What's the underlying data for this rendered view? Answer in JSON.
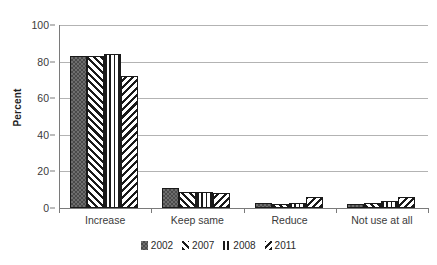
{
  "chart_data": {
    "type": "bar",
    "title": "",
    "xlabel": "",
    "ylabel": "Percent",
    "ylim": [
      0,
      100
    ],
    "yticks": [
      0,
      20,
      40,
      60,
      80,
      100
    ],
    "grid": true,
    "legend_position": "bottom",
    "categories": [
      "Increase",
      "Keep same",
      "Reduce",
      "Not use at all"
    ],
    "series": [
      {
        "name": "2002",
        "pattern": "checker-dotted",
        "values": [
          83,
          11,
          3,
          2
        ]
      },
      {
        "name": "2007",
        "pattern": "forward-diagonal",
        "values": [
          83,
          9,
          2,
          3
        ]
      },
      {
        "name": "2008",
        "pattern": "vertical-lines",
        "values": [
          84,
          9,
          3,
          4
        ]
      },
      {
        "name": "2011",
        "pattern": "backward-diagonal",
        "values": [
          72,
          8,
          6,
          6
        ]
      }
    ]
  },
  "axis": {
    "y_title": "Percent",
    "y_tick_labels": [
      "100",
      "80",
      "60",
      "40",
      "20",
      "0"
    ],
    "x_tick_labels": [
      "Increase",
      "Keep same",
      "Reduce",
      "Not use at all"
    ]
  },
  "legend": {
    "items": [
      {
        "label": "2002"
      },
      {
        "label": "2007"
      },
      {
        "label": "2008"
      },
      {
        "label": "2011"
      }
    ]
  },
  "colors": {
    "axis": "#7a7a7a",
    "gridline": "#b3b3b3",
    "bar_outline": "#1a1a1a",
    "series_2002_fill": "#6e6e6e",
    "text": "#3a3a3a"
  }
}
